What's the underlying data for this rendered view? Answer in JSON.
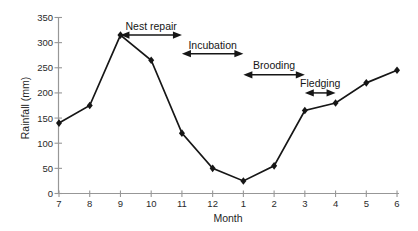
{
  "chart_data": {
    "type": "line",
    "title": "",
    "xlabel": "Month",
    "ylabel": "Rainfall (mm)",
    "categories": [
      "7",
      "8",
      "9",
      "10",
      "11",
      "12",
      "1",
      "2",
      "3",
      "4",
      "5",
      "6"
    ],
    "series": [
      {
        "name": "Rainfall",
        "values": [
          140,
          175,
          315,
          265,
          120,
          50,
          25,
          55,
          165,
          180,
          220,
          245
        ],
        "color": "#161616",
        "marker": "diamond"
      }
    ],
    "ylim": [
      0,
      350
    ],
    "yticks": [
      0,
      50,
      100,
      150,
      200,
      250,
      300,
      350
    ],
    "grid": "off",
    "legend": "none",
    "axis_color": "#979797",
    "text_color": "#2a2a2a",
    "annotations": [
      {
        "label": "Nest repair",
        "from_category": "9",
        "to_category": "11",
        "arrow_y_mm": 315,
        "label_y_mm": 334
      },
      {
        "label": "Incubation",
        "from_category": "11",
        "to_category": "1",
        "arrow_y_mm": 278,
        "label_y_mm": 296
      },
      {
        "label": "Brooding",
        "from_category": "1",
        "to_category": "3",
        "arrow_y_mm": 236,
        "label_y_mm": 255
      },
      {
        "label": "Fledging",
        "from_category": "3",
        "to_category": "4",
        "arrow_y_mm": 200,
        "label_y_mm": 219
      }
    ]
  }
}
